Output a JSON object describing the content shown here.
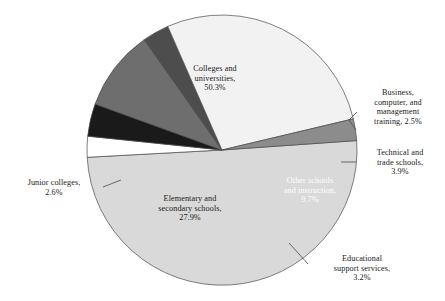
{
  "chart_data": {
    "type": "pie",
    "title": "",
    "subtitle": "",
    "xlabel": "",
    "ylabel": "",
    "legend": "none",
    "grid": false,
    "units": "percent",
    "total": 100.1,
    "start_angle_deg": -4,
    "direction": "clockwise",
    "categories": [
      "Colleges and universities",
      "Business, computer, and management training",
      "Technical and trade schools",
      "Other schools and instruction",
      "Educational support services",
      "Elementary and secondary schools",
      "Junior colleges"
    ],
    "values": [
      50.3,
      2.5,
      3.9,
      9.7,
      3.2,
      27.9,
      2.6
    ],
    "colors": [
      "#d9d9d9",
      "#ffffff",
      "#1a1a1a",
      "#6e6e6e",
      "#4d4d4d",
      "#f2f2f2",
      "#8c8c8c"
    ],
    "slices": [
      {
        "name": "colleges-and-universities",
        "label": "Colleges and\nuniversities,\n50.3%",
        "category": "Colleges and universities",
        "value": 50.3,
        "value_text": "50.3%",
        "color": "#d9d9d9",
        "label_placement": "inside",
        "label_color": "#1a1a1a",
        "leader": false
      },
      {
        "name": "business-computer-management-training",
        "label": "Business,\ncomputer, and\nmanagement\ntraining, 2.5%",
        "category": "Business, computer, and management training",
        "value": 2.5,
        "value_text": "2.5%",
        "color": "#ffffff",
        "label_placement": "outside-right",
        "label_color": "#1a1a1a",
        "leader": true
      },
      {
        "name": "technical-and-trade-schools",
        "label": "Technical and\ntrade schools,\n3.9%",
        "category": "Technical and trade schools",
        "value": 3.9,
        "value_text": "3.9%",
        "color": "#1a1a1a",
        "label_placement": "outside-right",
        "label_color": "#1a1a1a",
        "leader": true
      },
      {
        "name": "other-schools-and-instruction",
        "label": "Other schools\nand instruction,\n9.7%",
        "category": "Other schools and instruction",
        "value": 9.7,
        "value_text": "9.7%",
        "color": "#6e6e6e",
        "label_placement": "inside",
        "label_color": "#ffffff",
        "leader": false
      },
      {
        "name": "educational-support-services",
        "label": "Educational\nsupport services,\n3.2%",
        "category": "Educational support services",
        "value": 3.2,
        "value_text": "3.2%",
        "color": "#4d4d4d",
        "label_placement": "outside-bottom-right",
        "label_color": "#1a1a1a",
        "leader": true
      },
      {
        "name": "elementary-and-secondary-schools",
        "label": "Elementary and\nsecondary schools,\n27.9%",
        "category": "Elementary and secondary schools",
        "value": 27.9,
        "value_text": "27.9%",
        "color": "#f2f2f2",
        "label_placement": "inside",
        "label_color": "#1a1a1a",
        "leader": false
      },
      {
        "name": "junior-colleges",
        "label": "Junior colleges,\n2.6%",
        "category": "Junior colleges",
        "value": 2.6,
        "value_text": "2.6%",
        "color": "#8c8c8c",
        "label_placement": "outside-left",
        "label_color": "#1a1a1a",
        "leader": true
      }
    ]
  },
  "figure": {
    "center_x": 222,
    "center_y": 150,
    "radius": 135,
    "outline_color": "#4a4a4a",
    "background": "#ffffff"
  }
}
